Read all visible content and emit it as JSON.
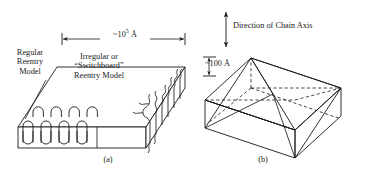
{
  "figure": {
    "type": "scientific-diagram",
    "background_color": "#ffffff",
    "line_color": "#1a1a1a",
    "panels": [
      {
        "id": "a",
        "caption": "(a)",
        "description": "Lamellar slab showing regular reentry folds on the left and irregular switchboard reentry on the right"
      },
      {
        "id": "b",
        "caption": "(b)",
        "description": "Hollow pyramid sectored lamellar crystal with dashed hidden edges"
      }
    ],
    "labels": {
      "regular_reentry": "Regular\nReentry\nModel",
      "switchboard": "Irregular or\n“Switchboard”\nReentry Model",
      "length_prefix": "~10",
      "length_exponent": "5",
      "length_unit": "Å",
      "thickness": "~100 Å",
      "chain_axis": "Direction of Chain Axis"
    },
    "captions": {
      "a": "(a)",
      "b": "(b)"
    },
    "dimensions": {
      "lateral_size": "~10⁵ Å",
      "lamellar_thickness": "~100 Å"
    }
  }
}
